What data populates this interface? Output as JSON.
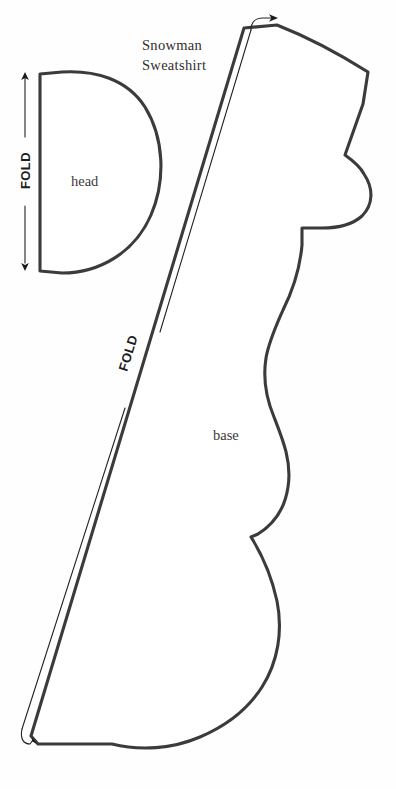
{
  "document": {
    "title_line_1": "Snowman",
    "title_line_2": "Sweatshirt",
    "background_color": "#fefefe",
    "outline_color": "#3b3b3b",
    "guide_color": "#222222",
    "text_color": "#2e2e2e"
  },
  "pieces": [
    {
      "id": "head",
      "label": "head",
      "fold_label": "FOLD",
      "description": "half-circle head piece cut on fold",
      "fold_edge": "left-vertical"
    },
    {
      "id": "base",
      "label": "base",
      "fold_label": "FOLD",
      "description": "snowman body silhouette with hat, brim, face and body cut on fold",
      "fold_edge": "left-diagonal"
    }
  ],
  "labels": {
    "head": "head",
    "base": "base",
    "fold_head": "FOLD",
    "fold_base": "FOLD"
  },
  "icons": {
    "fold_arrow_head_top": "arrow-up-icon",
    "fold_arrow_head_bottom": "arrow-down-icon",
    "fold_arrow_base_top": "arrow-curved-right-icon",
    "fold_arrow_base_bottom": "arrow-curved-down-icon"
  }
}
